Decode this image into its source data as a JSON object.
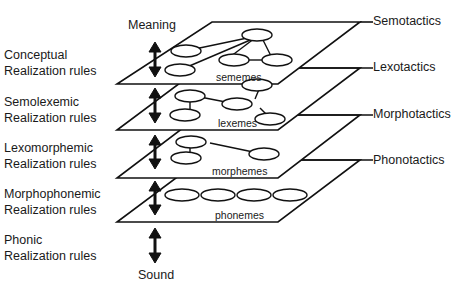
{
  "diagram": {
    "top_label": "Meaning",
    "bottom_label": "Sound",
    "realization_rules": [
      {
        "line1": "Conceptual",
        "line2": "Realization rules"
      },
      {
        "line1": "Semolexemic",
        "line2": "Realization rules"
      },
      {
        "line1": "Lexomorphemic",
        "line2": "Realization rules"
      },
      {
        "line1": "Morphophonemic",
        "line2": "Realization rules"
      },
      {
        "line1": "Phonic",
        "line2": "Realization rules"
      }
    ],
    "tactics": [
      "Semotactics",
      "Lexotactics",
      "Morphotactics",
      "Phonotactics"
    ],
    "planes": [
      "sememes",
      "lexemes",
      "morphemes",
      "phonemes"
    ]
  }
}
